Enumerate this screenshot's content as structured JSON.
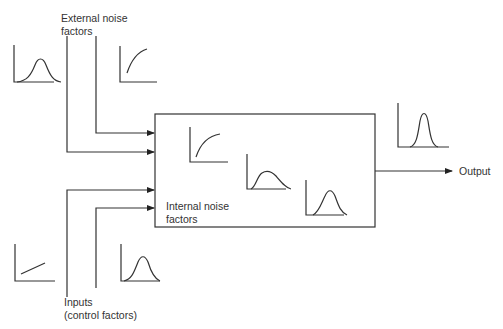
{
  "diagram": {
    "type": "process-noise-diagram",
    "labels": {
      "external_noise": [
        "External noise",
        "factors"
      ],
      "internal_noise": [
        "Internal noise",
        "factors"
      ],
      "inputs": [
        "Inputs",
        "(control factors)"
      ],
      "output": "Output"
    },
    "process_box": {
      "x": 155,
      "y": 114,
      "width": 220,
      "height": 113
    },
    "arrows": [
      {
        "name": "external-noise-arrow-1",
        "from": [
          96,
          26
        ],
        "via": [
          96,
          133
        ],
        "to": [
          155,
          133
        ]
      },
      {
        "name": "external-noise-arrow-2",
        "from": [
          67,
          26
        ],
        "via": [
          67,
          152
        ],
        "to": [
          155,
          152
        ]
      },
      {
        "name": "input-arrow-1",
        "from": [
          67,
          300
        ],
        "via": [
          67,
          190
        ],
        "to": [
          155,
          190
        ]
      },
      {
        "name": "input-arrow-2",
        "from": [
          96,
          290
        ],
        "via": [
          96,
          208
        ],
        "to": [
          155,
          208
        ]
      },
      {
        "name": "output-arrow",
        "from": [
          375,
          171
        ],
        "to": [
          445,
          171
        ]
      }
    ],
    "mini_plots": [
      {
        "name": "external-noise-bell-plot",
        "shape": "bell",
        "x": 13,
        "y": 45
      },
      {
        "name": "external-noise-saturation-plot",
        "shape": "saturation",
        "x": 119,
        "y": 45
      },
      {
        "name": "internal-saturation-plot",
        "shape": "saturation",
        "x": 189,
        "y": 127
      },
      {
        "name": "internal-skewed-plot",
        "shape": "skewed",
        "x": 246,
        "y": 154
      },
      {
        "name": "internal-bell-plot",
        "shape": "bell",
        "x": 305,
        "y": 180
      },
      {
        "name": "output-narrow-bell-plot",
        "shape": "narrow-bell",
        "x": 397,
        "y": 103
      },
      {
        "name": "input-linear-plot",
        "shape": "linear",
        "x": 14,
        "y": 244
      },
      {
        "name": "input-bell-plot",
        "shape": "bell",
        "x": 120,
        "y": 244
      }
    ]
  }
}
